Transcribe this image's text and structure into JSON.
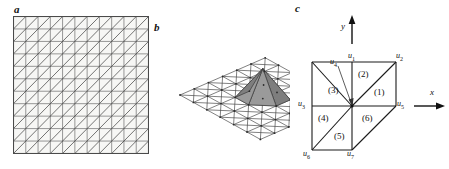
{
  "figure": {
    "panels": [
      {
        "id": "a",
        "letter": "a",
        "caption": "triangulated square grid",
        "grid": {
          "cols": 11,
          "rows": 11,
          "diagonal": "bottom-left-to-top-right"
        }
      },
      {
        "id": "b",
        "letter": "b",
        "caption": "3D perspective mesh with pyramid basis function",
        "grid": {
          "cols": 6,
          "rows": 6,
          "diagonal": "both"
        }
      },
      {
        "id": "c",
        "letter": "c",
        "caption": "node support patch with numbered triangles"
      }
    ]
  },
  "panel_c": {
    "axes": [
      {
        "name": "x-axis",
        "label": "x",
        "direction": "right"
      },
      {
        "name": "y-axis",
        "label": "y",
        "direction": "up"
      }
    ],
    "nodes": [
      {
        "id": "u1",
        "base": "u",
        "sub": "1",
        "position": "top-center"
      },
      {
        "id": "u2",
        "base": "u",
        "sub": "2",
        "position": "top-right"
      },
      {
        "id": "u3",
        "base": "u",
        "sub": "3",
        "position": "mid-left"
      },
      {
        "id": "u4",
        "base": "u",
        "sub": "4",
        "position": "center",
        "has_leader_line": true
      },
      {
        "id": "u5",
        "base": "u",
        "sub": "5",
        "position": "mid-right"
      },
      {
        "id": "u6",
        "base": "u",
        "sub": "6",
        "position": "bottom-left"
      },
      {
        "id": "u7",
        "base": "u",
        "sub": "7",
        "position": "bottom-center"
      }
    ],
    "triangles": [
      {
        "id": "t1",
        "label": "(1)"
      },
      {
        "id": "t2",
        "label": "(2)"
      },
      {
        "id": "t3",
        "label": "(3)"
      },
      {
        "id": "t4",
        "label": "(4)"
      },
      {
        "id": "t5",
        "label": "(5)"
      },
      {
        "id": "t6",
        "label": "(6)"
      }
    ]
  },
  "colors": {
    "line": "#4d4d4d",
    "line_dark": "#1a1a1a",
    "text": "#111111",
    "background": "#ffffff",
    "grid_fill": "#f7f7f5",
    "pyramid_left": "#9a9a9a",
    "pyramid_mid": "#7e7e7e",
    "pyramid_right": "#c6c6c6"
  }
}
